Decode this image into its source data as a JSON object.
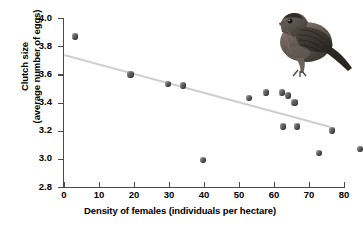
{
  "chart_data": {
    "type": "scatter",
    "title": "",
    "xlabel": "Density of females (individuals per hectare)",
    "ylabel": "Clutch size (average number of eggs)",
    "ylabel_line1": "Clutch size",
    "ylabel_line2": "(average number of eggs)",
    "xlim": [
      0,
      80
    ],
    "ylim": [
      2.8,
      4.0
    ],
    "xticks": [
      0,
      10,
      20,
      30,
      40,
      50,
      60,
      70,
      80
    ],
    "yticks": [
      "4.0",
      "3.8",
      "3.6",
      "3.4",
      "3.2",
      "3.0",
      "2.8"
    ],
    "ytick_values": [
      4.0,
      3.8,
      3.6,
      3.4,
      3.2,
      3.0,
      2.8
    ],
    "grid": false,
    "legend": null,
    "point_color": "#5d5d5d",
    "trendline_color": "#cfcfcf",
    "axis_color": "#4a4a4a",
    "points": [
      {
        "x": 3.2,
        "y": 3.87
      },
      {
        "x": 19.0,
        "y": 3.6
      },
      {
        "x": 29.7,
        "y": 3.53
      },
      {
        "x": 34.0,
        "y": 3.52
      },
      {
        "x": 39.7,
        "y": 2.99
      },
      {
        "x": 52.9,
        "y": 3.43
      },
      {
        "x": 57.7,
        "y": 3.47
      },
      {
        "x": 62.2,
        "y": 3.47
      },
      {
        "x": 64.0,
        "y": 3.45
      },
      {
        "x": 65.8,
        "y": 3.4
      },
      {
        "x": 62.6,
        "y": 3.23
      },
      {
        "x": 66.5,
        "y": 3.23
      },
      {
        "x": 76.5,
        "y": 3.2
      },
      {
        "x": 72.9,
        "y": 3.04
      },
      {
        "x": 84.5,
        "y": 3.07
      }
    ],
    "trendline": {
      "x0": 0.0,
      "y0": 3.745,
      "x1": 76.0,
      "y1": 3.235
    },
    "annotation_image": "house-finch-bird-photo"
  }
}
